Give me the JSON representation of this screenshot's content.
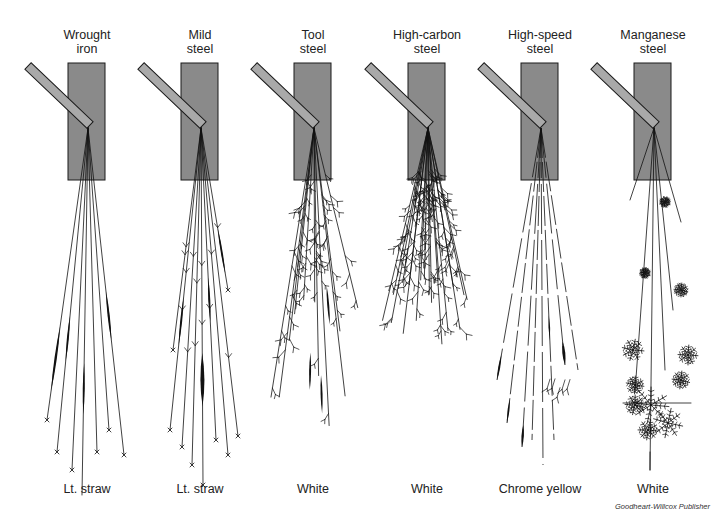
{
  "figure": {
    "credit": "Goodheart-Willcox Publisher",
    "colors": {
      "wheel_fill": "#8a8a8a",
      "bar_fill": "#a9a9a9",
      "outline": "#1a1a1a",
      "spark": "#111111"
    },
    "metals": [
      {
        "name_line1": "Wrought",
        "name_line2": "iron",
        "spark_color": "Lt. straw",
        "center": 87,
        "pattern": "long-straight-carrier-lines-with-swollen-spearheads"
      },
      {
        "name_line1": "Mild",
        "name_line2": "steel",
        "spark_color": "Lt. straw",
        "center": 200,
        "pattern": "long-lines-with-few-forks-and-spearheads"
      },
      {
        "name_line1": "Tool",
        "name_line2": "steel",
        "spark_color": "White",
        "center": 313,
        "pattern": "bushy-repeating-forked-bursts"
      },
      {
        "name_line1": "High-carbon",
        "name_line2": "steel",
        "spark_color": "White",
        "center": 427,
        "pattern": "short-dense-heavily-forked-bursts"
      },
      {
        "name_line1": "High-speed",
        "name_line2": "steel",
        "spark_color": "Chrome yellow",
        "center": 540,
        "pattern": "dashed-lines-with-teardrop-ends"
      },
      {
        "name_line1": "Manganese",
        "name_line2": "steel",
        "spark_color": "White",
        "center": 653,
        "pattern": "fan-shaped-star-bursts"
      }
    ]
  }
}
